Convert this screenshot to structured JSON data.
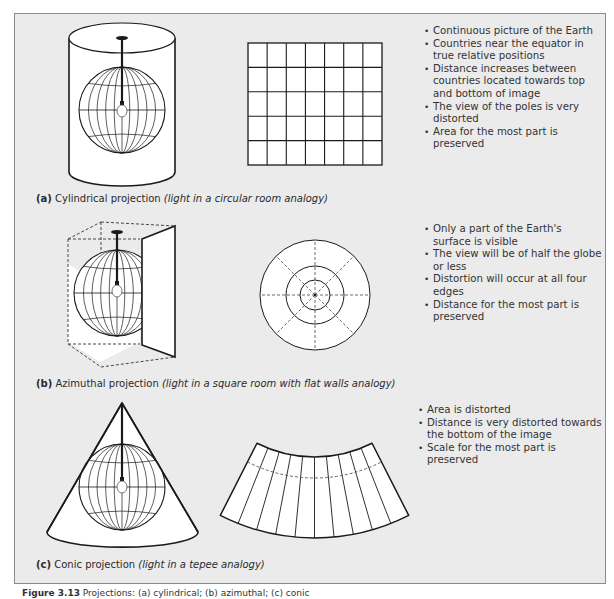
{
  "sections": [
    {
      "id": "a",
      "tag": "(a)",
      "name": "Cylindrical projection",
      "analogy": "(light in a circular room analogy)",
      "bullets": [
        "Continuous picture of the Earth",
        "Countries near the equator in true relative positions",
        "Distance increases between countries located towards top and bottom of image",
        "The view of the poles is very distorted",
        "Area for the most part is preserved"
      ]
    },
    {
      "id": "b",
      "tag": "(b)",
      "name": "Azimuthal projection",
      "analogy": "(light in a square room with flat walls analogy)",
      "bullets": [
        "Only a part of the Earth's surface is visible",
        "The view will be of half the globe or less",
        "Distortion will occur at all four edges",
        "Distance for the most part is preserved"
      ]
    },
    {
      "id": "c",
      "tag": "(c)",
      "name": "Conic projection",
      "analogy": "(light in a tepee analogy)",
      "bullets": [
        "Area is distorted",
        "Distance is very distorted towards the bottom of the image",
        "Scale for the most part is preserved"
      ]
    }
  ],
  "figure_caption": {
    "label": "Figure 3.13",
    "text": "Projections: (a) cylindrical; (b) azimuthal; (c) conic"
  },
  "projection_grid": {
    "columns": 7,
    "rows": 5
  },
  "conic_fan_segments": 10,
  "colors": {
    "panel_bg": "#ebebeb",
    "line": "#1a1a1a",
    "shape_fill": "#ffffff"
  }
}
